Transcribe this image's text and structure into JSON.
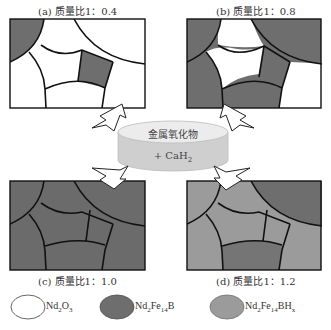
{
  "colors": {
    "nd2o3": "#ffffff",
    "nd2fe14b": "#6e6e6e",
    "nd2fe14bhx": "#9b9b9b",
    "grain_border": "#111111",
    "disc_top": "#eeeeee",
    "disc_side": "#cfcfcf"
  },
  "panels": [
    {
      "id": "a",
      "caption": "(a) 质量比1：0.4"
    },
    {
      "id": "b",
      "caption": "(b) 质量比1：0.8"
    },
    {
      "id": "c",
      "caption": "(c) 质量比1：1.0"
    },
    {
      "id": "d",
      "caption": "(d) 质量比1：1.2"
    }
  ],
  "center": {
    "line1": "金属氧化物",
    "line2_prefix": "+ CaH",
    "line2_sub": "2"
  },
  "legend": [
    {
      "name": "Nd2O3",
      "base": "Nd",
      "s1": "2",
      "mid": "O",
      "s2": "3",
      "tail": "",
      "s3": ""
    },
    {
      "name": "Nd2Fe14B",
      "base": "Nd",
      "s1": "2",
      "mid": "Fe",
      "s2": "14",
      "tail": "B",
      "s3": ""
    },
    {
      "name": "Nd2Fe14BHx",
      "base": "Nd",
      "s1": "2",
      "mid": "Fe",
      "s2": "14",
      "tail": "BH",
      "s3": "x"
    }
  ]
}
